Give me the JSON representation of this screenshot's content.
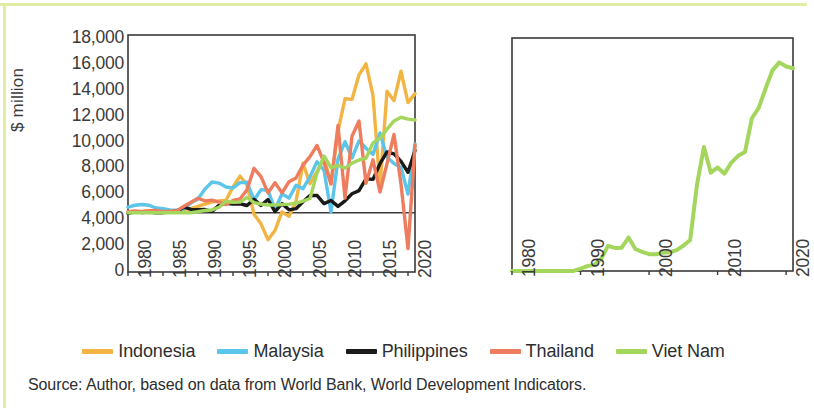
{
  "figure": {
    "source_note": "Source: Author, based on data from World Bank, World Development Indicators."
  },
  "legend": {
    "items": [
      {
        "label": "Indonesia",
        "color": "#f2b544"
      },
      {
        "label": "Malaysia",
        "color": "#5bc5ea"
      },
      {
        "label": "Philippines",
        "color": "#1a1a1a"
      },
      {
        "label": "Thailand",
        "color": "#ed7d5e"
      },
      {
        "label": "Viet Nam",
        "color": "#a4d65e"
      }
    ]
  },
  "chart_data": [
    {
      "id": "left-panel",
      "type": "line",
      "title": "",
      "xlabel": "",
      "ylabel": "$ million",
      "xlim": [
        1980,
        2021
      ],
      "ylim": [
        -10000,
        30000
      ],
      "ytick_labels": [
        "30,000",
        "25,000",
        "20,000",
        "15,000",
        "10,000",
        "5,000",
        "0",
        "-5,000",
        "-10,000"
      ],
      "yticks": [
        30000,
        25000,
        20000,
        15000,
        10000,
        5000,
        0,
        -5000,
        -10000
      ],
      "xtick_labels": [
        "1980",
        "1985",
        "1990",
        "1995",
        "2000",
        "2005",
        "2010",
        "2015",
        "2020"
      ],
      "xticks": [
        1980,
        1985,
        1990,
        1995,
        2000,
        2005,
        2010,
        2015,
        2020
      ],
      "grid": false,
      "zero_line": true,
      "legend_position": "bottom",
      "x": [
        1980,
        1981,
        1982,
        1983,
        1984,
        1985,
        1986,
        1987,
        1988,
        1989,
        1990,
        1991,
        1992,
        1993,
        1994,
        1995,
        1996,
        1997,
        1998,
        1999,
        2000,
        2001,
        2002,
        2003,
        2004,
        2005,
        2006,
        2007,
        2008,
        2009,
        2010,
        2011,
        2012,
        2013,
        2014,
        2015,
        2016,
        2017,
        2018,
        2019,
        2020,
        2021
      ],
      "series": [
        {
          "name": "Indonesia",
          "color": "#f2b544",
          "values": [
            180,
            130,
            220,
            290,
            220,
            310,
            260,
            390,
            570,
            680,
            1090,
            1480,
            1780,
            2000,
            2110,
            4350,
            6190,
            4680,
            -240,
            -1870,
            -4550,
            -2980,
            150,
            -600,
            1890,
            8340,
            4910,
            6930,
            9320,
            4880,
            13770,
            19240,
            19140,
            23280,
            25120,
            19780,
            4540,
            20510,
            18910,
            23880,
            18590,
            20100
          ]
        },
        {
          "name": "Malaysia",
          "color": "#5bc5ea",
          "values": [
            934,
            1265,
            1397,
            1261,
            797,
            695,
            489,
            423,
            719,
            1668,
            2332,
            3998,
            5183,
            5006,
            4342,
            4178,
            5078,
            5137,
            2163,
            3895,
            3788,
            554,
            3203,
            2473,
            4624,
            4065,
            6060,
            8595,
            7172,
            114,
            9060,
            12000,
            9240,
            12115,
            10880,
            9857,
            13470,
            9377,
            8299,
            7647,
            3164,
            11600
          ]
        },
        {
          "name": "Philippines",
          "color": "#1a1a1a",
          "values": [
            -106,
            172,
            16,
            105,
            9,
            12,
            127,
            307,
            936,
            563,
            530,
            544,
            228,
            1238,
            1591,
            1478,
            1517,
            1222,
            2287,
            1247,
            2240,
            195,
            1542,
            491,
            688,
            1854,
            2921,
            2916,
            1544,
            2065,
            1070,
            2007,
            3215,
            3737,
            5740,
            5639,
            8280,
            10256,
            9949,
            8671,
            6822,
            10518
          ]
        },
        {
          "name": "Thailand",
          "color": "#ed7d5e",
          "values": [
            189,
            291,
            191,
            348,
            400,
            163,
            262,
            352,
            1105,
            1775,
            2444,
            2014,
            2113,
            1804,
            1366,
            2068,
            2336,
            3895,
            7492,
            6091,
            3350,
            5073,
            3355,
            5235,
            5862,
            8048,
            9460,
            11359,
            8455,
            4854,
            14747,
            2474,
            12899,
            15493,
            4975,
            8928,
            3491,
            8285,
            13205,
            4845,
            -6058,
            11424
          ]
        },
        {
          "name": "Viet Nam",
          "color": "#a4d65e",
          "values": [
            0,
            0,
            0,
            0,
            0,
            0,
            0,
            0,
            0,
            4,
            180,
            375,
            474,
            926,
            1945,
            1780,
            1803,
            2587,
            1700,
            1484,
            1298,
            1300,
            1400,
            1450,
            1610,
            1954,
            2400,
            6700,
            9579,
            7600,
            8000,
            7519,
            8368,
            8900,
            9200,
            11800,
            12600,
            14100,
            15500,
            16120,
            15800,
            15660
          ]
        }
      ]
    },
    {
      "id": "right-panel",
      "type": "line",
      "title": "",
      "xlabel": "",
      "ylabel": "",
      "xlim": [
        1980,
        2021
      ],
      "ylim": [
        0,
        18000
      ],
      "ytick_labels": [
        "18,000",
        "16,000",
        "14,000",
        "12,000",
        "10,000",
        "8,000",
        "6,000",
        "4,000",
        "2,000",
        "0"
      ],
      "yticks": [
        18000,
        16000,
        14000,
        12000,
        10000,
        8000,
        6000,
        4000,
        2000,
        0
      ],
      "xtick_labels": [
        "1980",
        "1990",
        "2000",
        "2010",
        "2020"
      ],
      "xticks": [
        1980,
        1990,
        2000,
        2010,
        2020
      ],
      "grid": false,
      "zero_line": false,
      "legend_position": "bottom",
      "x": [
        1980,
        1981,
        1982,
        1983,
        1984,
        1985,
        1986,
        1987,
        1988,
        1989,
        1990,
        1991,
        1992,
        1993,
        1994,
        1995,
        1996,
        1997,
        1998,
        1999,
        2000,
        2001,
        2002,
        2003,
        2004,
        2005,
        2006,
        2007,
        2008,
        2009,
        2010,
        2011,
        2012,
        2013,
        2014,
        2015,
        2016,
        2017,
        2018,
        2019,
        2020,
        2021
      ],
      "series": [
        {
          "name": "Viet Nam",
          "color": "#a4d65e",
          "values": [
            0,
            0,
            0,
            0,
            0,
            0,
            0,
            0,
            0,
            4,
            180,
            375,
            474,
            926,
            1945,
            1780,
            1803,
            2587,
            1700,
            1484,
            1298,
            1300,
            1400,
            1450,
            1610,
            1954,
            2400,
            6700,
            9579,
            7600,
            8000,
            7519,
            8368,
            8900,
            9200,
            11800,
            12600,
            14100,
            15500,
            16120,
            15800,
            15660
          ]
        }
      ]
    }
  ]
}
